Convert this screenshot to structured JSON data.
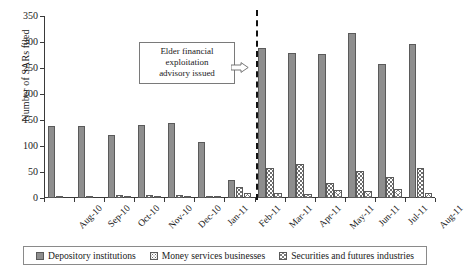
{
  "chart_data": {
    "type": "bar",
    "title": "",
    "xlabel": "",
    "ylabel": "Number of SARs filed",
    "ylim": [
      0,
      350
    ],
    "yticks": [
      0,
      50,
      100,
      150,
      200,
      250,
      300,
      350
    ],
    "grid": false,
    "legend_position": "bottom",
    "categories": [
      "Aug-10",
      "Sep-10",
      "Oct-10",
      "Nov-10",
      "Dec-10",
      "Jan-11",
      "Feb-11",
      "Mar-11",
      "Apr-11",
      "May-11",
      "Jun-11",
      "Jul-11",
      "Aug-11"
    ],
    "series": [
      {
        "name": "Depository institutions",
        "values": [
          138,
          139,
          122,
          140,
          145,
          107,
          35,
          288,
          279,
          277,
          317,
          257,
          297
        ]
      },
      {
        "name": "Money services businesses",
        "values": [
          1,
          1,
          6,
          6,
          5,
          3,
          22,
          57,
          65,
          28,
          51,
          40,
          57
        ]
      },
      {
        "name": "Securities and futures industries",
        "values": [
          0,
          0,
          1,
          1,
          2,
          1,
          9,
          9,
          7,
          16,
          14,
          17,
          10
        ]
      }
    ],
    "annotations": [
      {
        "name": "event-divider",
        "text": "Elder financial exploitation advisory issued",
        "lines": [
          "Elder financial",
          "exploitation",
          "advisory issued"
        ],
        "at_category": "Mar-11",
        "style": "dashed-vertical-line"
      }
    ]
  },
  "legend": {
    "items": [
      {
        "label": "Depository institutions",
        "swatch": "solid-gray-swatch"
      },
      {
        "label": "Money services businesses",
        "swatch": "dotted-swatch"
      },
      {
        "label": "Securities and futures industries",
        "swatch": "crosshatch-swatch"
      }
    ]
  }
}
